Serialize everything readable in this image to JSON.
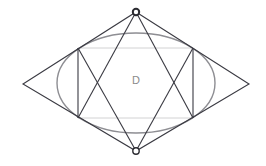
{
  "figure": {
    "width": 266,
    "height": 166,
    "background_color": "#ffffff"
  },
  "labels": {
    "region_D": "D"
  },
  "colors": {
    "polygon_stroke": "#3a3a42",
    "ellipse_stroke": "#8e8e93",
    "label_text": "#8a8a8a",
    "marker_fill": "#ffffff",
    "marker_stroke": "#2b2b31"
  },
  "geometry": {
    "rhombus": {
      "name": "outer-rhombus",
      "vertices": [
        {
          "name": "top",
          "x": 136,
          "y": 12
        },
        {
          "name": "right",
          "x": 249,
          "y": 84
        },
        {
          "name": "bottom",
          "x": 136,
          "y": 151
        },
        {
          "name": "left",
          "x": 23,
          "y": 84
        }
      ]
    },
    "ellipse": {
      "name": "inscribed-ellipse",
      "cx": 136,
      "cy": 83,
      "rx": 79,
      "ry": 50
    },
    "chord_points": [
      {
        "name": "upper-left",
        "x": 78,
        "y": 48
      },
      {
        "name": "upper-right",
        "x": 193,
        "y": 48
      },
      {
        "name": "lower-right",
        "x": 193,
        "y": 118
      },
      {
        "name": "lower-left",
        "x": 78,
        "y": 118
      }
    ],
    "segments": [
      {
        "name": "top-to-lower-left",
        "x1": 136,
        "y1": 12,
        "x2": 78,
        "y2": 118
      },
      {
        "name": "top-to-lower-right",
        "x1": 136,
        "y1": 12,
        "x2": 193,
        "y2": 118
      },
      {
        "name": "bottom-to-upper-left",
        "x1": 136,
        "y1": 151,
        "x2": 78,
        "y2": 48
      },
      {
        "name": "bottom-to-upper-right",
        "x1": 136,
        "y1": 151,
        "x2": 193,
        "y2": 48
      },
      {
        "name": "upper-left-to-lower-left",
        "x1": 78,
        "y1": 48,
        "x2": 78,
        "y2": 118
      },
      {
        "name": "upper-right-to-lower-right",
        "x1": 193,
        "y1": 48,
        "x2": 193,
        "y2": 118
      },
      {
        "name": "upper-chord",
        "x1": 78,
        "y1": 48,
        "x2": 193,
        "y2": 48
      },
      {
        "name": "lower-chord",
        "x1": 78,
        "y1": 118,
        "x2": 193,
        "y2": 118
      }
    ],
    "markers": [
      {
        "name": "top-vertex-marker",
        "cx": 136,
        "cy": 12,
        "r": 3.2,
        "style": "filled-ring"
      },
      {
        "name": "bottom-vertex-marker",
        "cx": 136,
        "cy": 151,
        "r": 3.2,
        "style": "open-ring"
      }
    ],
    "label_position": {
      "x": 136,
      "y": 81
    }
  }
}
